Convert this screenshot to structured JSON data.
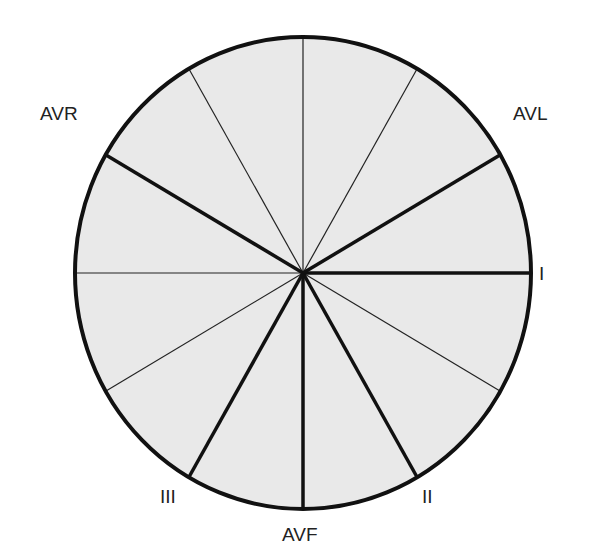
{
  "diagram": {
    "fill_color": "#e8e8e8",
    "line_color": "#111111",
    "center": [
      303,
      273
    ],
    "radius_x": 228,
    "radius_y": 236,
    "divisions_deg": 30,
    "leads": [
      {
        "label": "I",
        "angle_deg": 0
      },
      {
        "label": "II",
        "angle_deg": 60
      },
      {
        "label": "AVF",
        "angle_deg": 90
      },
      {
        "label": "III",
        "angle_deg": 120
      },
      {
        "label": "AVR",
        "angle_deg": -150
      },
      {
        "label": "AVL",
        "angle_deg": -30
      }
    ]
  },
  "labels": {
    "I": "I",
    "II": "II",
    "III": "III",
    "AVF": "AVF",
    "AVR": "AVR",
    "AVL": "AVL"
  }
}
